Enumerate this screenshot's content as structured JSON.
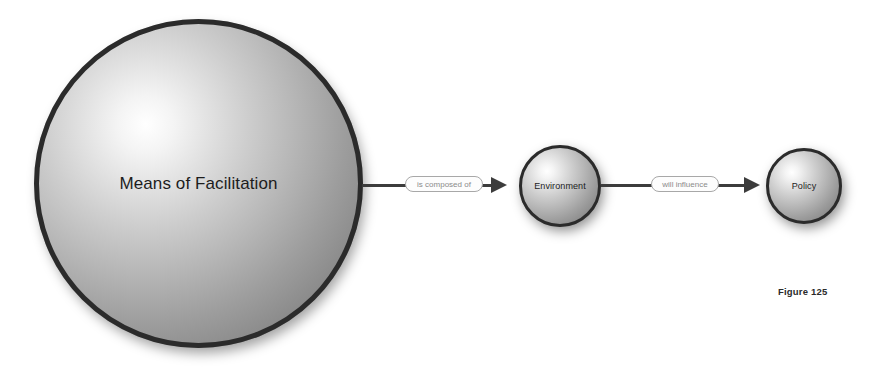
{
  "figure": {
    "caption": "Figure 125",
    "background_color": "#ffffff"
  },
  "diagram": {
    "type": "concept-map",
    "orientation": "left-to-right",
    "nodes": [
      {
        "id": "means",
        "label": "Means of Facilitation",
        "shape": "sphere",
        "size": "large",
        "fill_style": "radial-gradient-gray",
        "border_color": "#2b2b2b"
      },
      {
        "id": "environment",
        "label": "Environment",
        "shape": "sphere",
        "size": "medium",
        "fill_style": "radial-gradient-gray",
        "border_color": "#2b2b2b"
      },
      {
        "id": "policy",
        "label": "Policy",
        "shape": "sphere",
        "size": "small",
        "fill_style": "radial-gradient-gray",
        "border_color": "#2b2b2b"
      }
    ],
    "links": [
      {
        "id": "link-1",
        "from": "means",
        "to": "environment",
        "label": "is composed of",
        "arrow": "arrowhead-right",
        "line_color": "#3c3c3c"
      },
      {
        "id": "link-2",
        "from": "environment",
        "to": "policy",
        "label": "will influence",
        "arrow": "arrowhead-right",
        "line_color": "#3c3c3c"
      }
    ]
  }
}
